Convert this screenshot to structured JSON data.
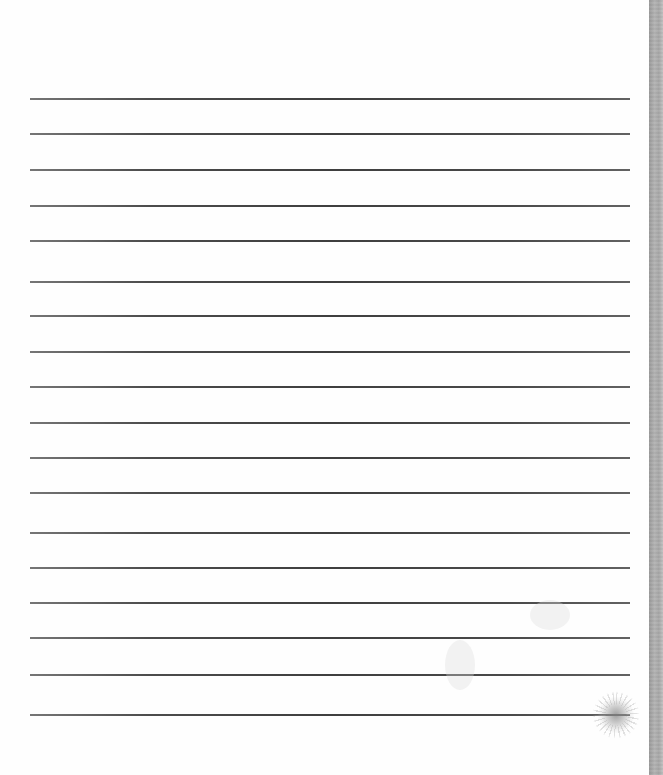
{
  "document": {
    "type": "lined-notebook-page",
    "line_count": 18,
    "lines": [
      {
        "y": 98
      },
      {
        "y": 133
      },
      {
        "y": 169
      },
      {
        "y": 205
      },
      {
        "y": 240
      },
      {
        "y": 281
      },
      {
        "y": 315
      },
      {
        "y": 351
      },
      {
        "y": 386
      },
      {
        "y": 422
      },
      {
        "y": 457
      },
      {
        "y": 492
      },
      {
        "y": 532
      },
      {
        "y": 567
      },
      {
        "y": 602
      },
      {
        "y": 637
      },
      {
        "y": 674
      },
      {
        "y": 714
      }
    ],
    "text_content": "",
    "colors": {
      "paper": "#fefefe",
      "rule": "#333333",
      "binding": "#aaaaaa"
    }
  }
}
